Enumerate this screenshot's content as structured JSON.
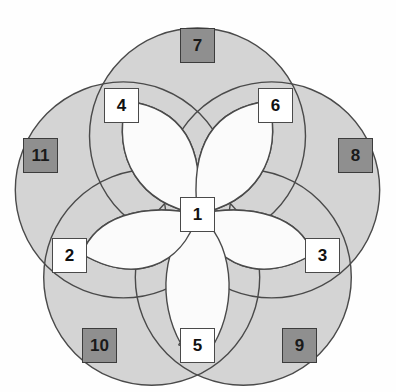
{
  "diagram": {
    "type": "overlapping-circles-rosette",
    "title": "",
    "canvas": {
      "width": 396,
      "height": 392
    },
    "colors": {
      "background": "#fefefe",
      "region_fill": "#d4d4d4",
      "petal_fill": "#fbfbfb",
      "outline": "#4a4a4a",
      "node_white_fill": "#ffffff",
      "node_gray_fill": "#8f8f8f",
      "node_border": "#3c3c3c",
      "node_text": "#111111"
    },
    "geometry": {
      "center": {
        "x": 197.5,
        "y": 214
      },
      "circle_radius": 108,
      "circle_centers": [
        {
          "x": 197.5,
          "y": 136
        },
        {
          "x": 271.7,
          "y": 189.9
        },
        {
          "x": 243.3,
          "y": 277.3
        },
        {
          "x": 151.7,
          "y": 277.3
        },
        {
          "x": 123.3,
          "y": 189.9
        }
      ],
      "petal_count": 5
    },
    "nodes": [
      {
        "id": "1",
        "label": "1",
        "style": "white",
        "x": 180,
        "y": 197,
        "role": "center-hub"
      },
      {
        "id": "2",
        "label": "2",
        "style": "white",
        "x": 52,
        "y": 238,
        "role": "petal-tip"
      },
      {
        "id": "3",
        "label": "3",
        "style": "white",
        "x": 305,
        "y": 238,
        "role": "petal-tip"
      },
      {
        "id": "4",
        "label": "4",
        "style": "white",
        "x": 104,
        "y": 88,
        "role": "petal-tip"
      },
      {
        "id": "5",
        "label": "5",
        "style": "white",
        "x": 180,
        "y": 328,
        "role": "petal-tip"
      },
      {
        "id": "6",
        "label": "6",
        "style": "white",
        "x": 258,
        "y": 88,
        "role": "petal-tip"
      },
      {
        "id": "7",
        "label": "7",
        "style": "gray",
        "x": 180,
        "y": 28,
        "role": "outer-boundary"
      },
      {
        "id": "8",
        "label": "8",
        "style": "gray",
        "x": 338,
        "y": 138,
        "role": "outer-boundary"
      },
      {
        "id": "9",
        "label": "9",
        "style": "gray",
        "x": 282,
        "y": 328,
        "role": "outer-boundary"
      },
      {
        "id": "10",
        "label": "10",
        "style": "gray",
        "x": 82,
        "y": 328,
        "role": "outer-boundary"
      },
      {
        "id": "11",
        "label": "11",
        "style": "gray",
        "x": 23,
        "y": 138,
        "role": "outer-boundary"
      }
    ]
  }
}
